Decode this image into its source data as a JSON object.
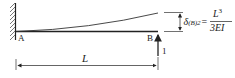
{
  "diagram": {
    "type": "cantilever-beam-deflection",
    "support_label": "A",
    "free_end_label": "B",
    "load_label": "1",
    "length_label": "L",
    "deflection": {
      "symbol": "δ",
      "subscript": "(B)2",
      "equals": "=",
      "numerator": "L",
      "numerator_exp": "3",
      "denominator": "3EI"
    },
    "colors": {
      "line": "#222222",
      "hatch": "#555555",
      "background": "#ffffff"
    }
  }
}
